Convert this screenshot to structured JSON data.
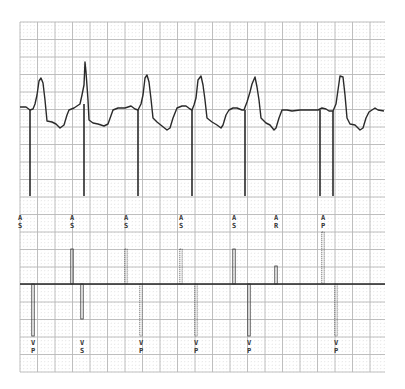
{
  "strip": {
    "grid": {
      "left": 20,
      "top": 22,
      "right": 385,
      "bottom": 372,
      "major_step": 17.5,
      "minor_step": 3.5,
      "major_color": "#b8b8b8",
      "minor_color": "#d4d4d4"
    },
    "colors": {
      "trace": "#2a2a2a",
      "marker": "#333333",
      "baseline": "#222222"
    },
    "ecg": {
      "baseline_y": 108,
      "points": "20,107 26,107 30,110 33,109 35,104 37,95 39,81 41,78 43,83 45,100 47,121 52,122 56,124 60,128 64,125 67,115 69,110 74,108 77,106 80,104 82,95 84,85 85,62 86,72 88,100 89,120 93,123 98,124 104,126 108,124 113,110 118,108 125,108 131,106 135,109 138,110 141,104 143,95 145,78 147,75 149,82 151,99 153,118 157,122 162,126 167,130 170,128 173,118 177,108 182,106 186,106 190,109 192,110 194,105 196,98 198,80 201,76 203,85 205,100 207,118 212,122 217,125 221,128 223,125 226,115 229,110 233,108 237,108 242,110 244,110 247,102 250,92 252,84 255,77 257,87 259,100 261,118 266,123 270,125 274,130 276,128 279,118 282,110 287,110 292,111 300,110 310,110 318,110 322,108 326,109 329,111 333,111 336,104 338,90 340,76 343,77 345,95 347,118 350,124 355,125 360,130 363,128 366,118 369,112 372,110 375,108 378,110 384,111",
      "pacing_spikes": [
        {
          "x": 30,
          "y1": 110,
          "y2": 196
        },
        {
          "x": 84,
          "y1": 104,
          "y2": 196
        },
        {
          "x": 138,
          "y1": 110,
          "y2": 196
        },
        {
          "x": 192,
          "y1": 110,
          "y2": 196
        },
        {
          "x": 245,
          "y1": 110,
          "y2": 196
        },
        {
          "x": 320,
          "y1": 110,
          "y2": 196
        },
        {
          "x": 333,
          "y1": 111,
          "y2": 196
        }
      ]
    },
    "marker_channel": {
      "baseline_y": 284,
      "atrial": [
        {
          "x": 20,
          "top": null,
          "code": [
            "A",
            "S"
          ],
          "label_y": 220,
          "style": "solid"
        },
        {
          "x": 72,
          "top": 249,
          "code": [
            "A",
            "S"
          ],
          "label_y": 220,
          "style": "solid"
        },
        {
          "x": 126,
          "top": 249,
          "code": [
            "A",
            "S"
          ],
          "label_y": 220,
          "style": "dotted"
        },
        {
          "x": 181,
          "top": 249,
          "code": [
            "A",
            "S"
          ],
          "label_y": 220,
          "style": "dotted"
        },
        {
          "x": 234,
          "top": 249,
          "code": [
            "A",
            "S"
          ],
          "label_y": 220,
          "style": "solid"
        },
        {
          "x": 276,
          "top": 266,
          "code": [
            "A",
            "R"
          ],
          "label_y": 220,
          "style": "solid"
        },
        {
          "x": 323,
          "top": 232,
          "code": [
            "A",
            "P"
          ],
          "label_y": 220,
          "style": "dotted"
        }
      ],
      "ventricular": [
        {
          "x": 33,
          "bottom": 336,
          "code": [
            "V",
            "P"
          ],
          "label_y": 345,
          "style": "solid"
        },
        {
          "x": 82,
          "bottom": 319,
          "code": [
            "V",
            "S"
          ],
          "label_y": 345,
          "style": "solid"
        },
        {
          "x": 141,
          "bottom": 336,
          "code": [
            "V",
            "P"
          ],
          "label_y": 345,
          "style": "dotted"
        },
        {
          "x": 196,
          "bottom": 336,
          "code": [
            "V",
            "P"
          ],
          "label_y": 345,
          "style": "dotted"
        },
        {
          "x": 249,
          "bottom": 336,
          "code": [
            "V",
            "P"
          ],
          "label_y": 345,
          "style": "solid"
        },
        {
          "x": 336,
          "bottom": 336,
          "code": [
            "V",
            "P"
          ],
          "label_y": 345,
          "style": "dotted"
        }
      ]
    }
  }
}
